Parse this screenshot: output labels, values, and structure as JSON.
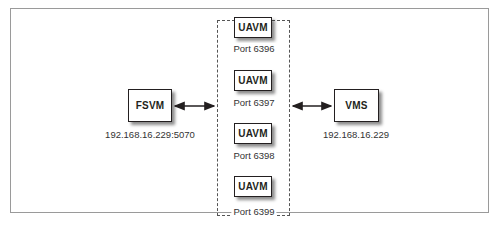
{
  "diagram": {
    "left_node": {
      "label": "FSVM",
      "address": "192.168.16.229:5070"
    },
    "right_node": {
      "label": "VMS",
      "address": "192.168.16.229"
    },
    "group": {
      "style": "dashed",
      "nodes": [
        {
          "label": "UAVM",
          "port": "Port 6396"
        },
        {
          "label": "UAVM",
          "port": "Port 6397"
        },
        {
          "label": "UAVM",
          "port": "Port 6398"
        },
        {
          "label": "UAVM",
          "port": "Port 6399"
        }
      ]
    },
    "connections": [
      {
        "from": "FSVM",
        "to": "UAVM group",
        "type": "bidirectional"
      },
      {
        "from": "UAVM group",
        "to": "VMS",
        "type": "bidirectional"
      }
    ]
  }
}
